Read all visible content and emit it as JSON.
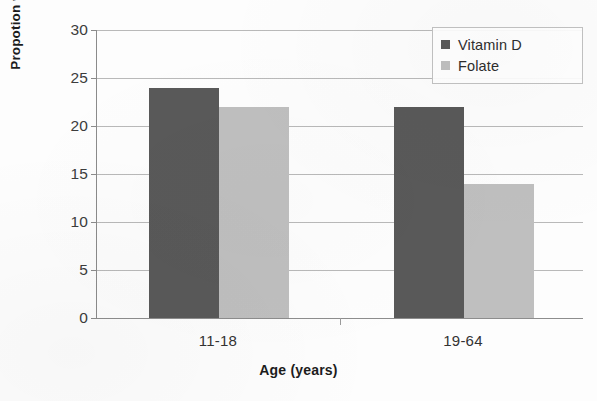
{
  "chart_data": {
    "type": "bar",
    "title": "",
    "subtitle": "",
    "xlabel": "Age (years)",
    "ylabel": "Propotion with levels indicating deficiency (%)",
    "categories": [
      "11-18",
      "19-64"
    ],
    "series": [
      {
        "name": "Vitamin D",
        "values": [
          24,
          22
        ],
        "color": "#595959"
      },
      {
        "name": "Folate",
        "values": [
          22,
          14
        ],
        "color": "#bfbfbf"
      }
    ],
    "ylim": [
      0,
      30
    ],
    "yticks": [
      0,
      5,
      10,
      15,
      20,
      25,
      30
    ],
    "ytick_labels": [
      "0",
      "5",
      "10",
      "15",
      "20",
      "25",
      "30"
    ],
    "grid": "horizontal",
    "legend_position": "top-right",
    "legend_boxed": true,
    "bar_grouping": "clustered",
    "annotations": []
  },
  "legend": {
    "entries": [
      {
        "label": "Vitamin D",
        "swatch_color": "#595959"
      },
      {
        "label": "Folate",
        "swatch_color": "#bfbfbf"
      }
    ]
  },
  "axes": {
    "y_title": "Propotion with levels indicating deficiency (%)",
    "x_title": "Age (years)",
    "y_tick_labels": [
      "30",
      "25",
      "20",
      "15",
      "10",
      "5",
      "0"
    ],
    "x_tick_labels": [
      "11-18",
      "19-64"
    ]
  },
  "colors": {
    "vitamin_d": "#595959",
    "folate": "#bfbfbf",
    "gridline": "#b9b9b9",
    "axis": "#8b8b8b",
    "text": "#1c1c1c",
    "background": "#fdfdfd"
  }
}
